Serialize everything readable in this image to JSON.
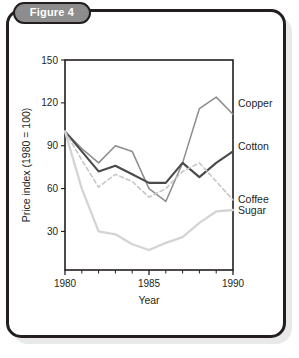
{
  "figure": {
    "badge_label": "Figure 4",
    "badge_bg": "#8d8d8d",
    "border_color": "#231f20",
    "panel_bg": "#ffffff"
  },
  "chart_data": {
    "type": "line",
    "title": "",
    "xlabel": "Year",
    "ylabel": "Price index (1980 = 100)",
    "xlim": [
      1980,
      1990
    ],
    "ylim": [
      3,
      150
    ],
    "xticks": [
      1980,
      1985,
      1990
    ],
    "xtick_labels": [
      "1980",
      "1985",
      "1990"
    ],
    "xminor_ticks": [
      1981,
      1982,
      1983,
      1984,
      1986,
      1987,
      1988,
      1989
    ],
    "yticks": [
      30,
      60,
      90,
      120,
      150
    ],
    "ytick_labels": [
      "30",
      "60",
      "90",
      "120",
      "150"
    ],
    "grid": false,
    "legend_position": "right-inline",
    "x": [
      1980,
      1981,
      1982,
      1983,
      1984,
      1985,
      1986,
      1987,
      1988,
      1989,
      1990
    ],
    "series": [
      {
        "name": "Copper",
        "color": "#8c8c8c",
        "width": 1.5,
        "dash": "none",
        "label_y": 120,
        "values": [
          100,
          88,
          78,
          90,
          86,
          60,
          51,
          78,
          116,
          124,
          112
        ]
      },
      {
        "name": "Cotton",
        "color": "#4a4a4a",
        "width": 2.1,
        "dash": "none",
        "label_y": 90,
        "values": [
          100,
          86,
          72,
          76,
          70,
          64,
          64,
          78,
          68,
          78,
          86
        ]
      },
      {
        "name": "Coffee",
        "color": "#c6c6c6",
        "width": 1.6,
        "dash": "4,3",
        "label_y": 53,
        "values": [
          100,
          80,
          61,
          70,
          65,
          54,
          60,
          72,
          78,
          65,
          52
        ]
      },
      {
        "name": "Sugar",
        "color": "#d4d4d4",
        "width": 2.3,
        "dash": "none",
        "label_y": 45,
        "values": [
          100,
          60,
          30,
          28,
          21,
          17,
          22,
          26,
          36,
          44,
          45
        ]
      }
    ]
  }
}
